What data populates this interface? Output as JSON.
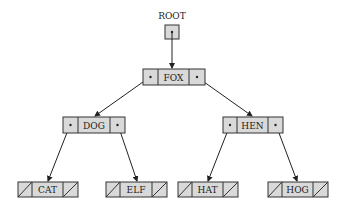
{
  "diagram": {
    "type": "binary-search-tree",
    "root_label": "ROOT",
    "colors": {
      "cell_fill": "#d9d9d9",
      "stroke": "#333333",
      "background": "#ffffff"
    },
    "nodes": [
      {
        "id": "fox",
        "key": "FOX",
        "left": "dog",
        "right": "hen"
      },
      {
        "id": "dog",
        "key": "DOG",
        "left": "cat",
        "right": "elf"
      },
      {
        "id": "hen",
        "key": "HEN",
        "left": "hat",
        "right": "hog"
      },
      {
        "id": "cat",
        "key": "CAT",
        "left": null,
        "right": null
      },
      {
        "id": "elf",
        "key": "ELF",
        "left": null,
        "right": null
      },
      {
        "id": "hat",
        "key": "HAT",
        "left": null,
        "right": null
      },
      {
        "id": "hog",
        "key": "HOG",
        "left": null,
        "right": null
      }
    ]
  }
}
